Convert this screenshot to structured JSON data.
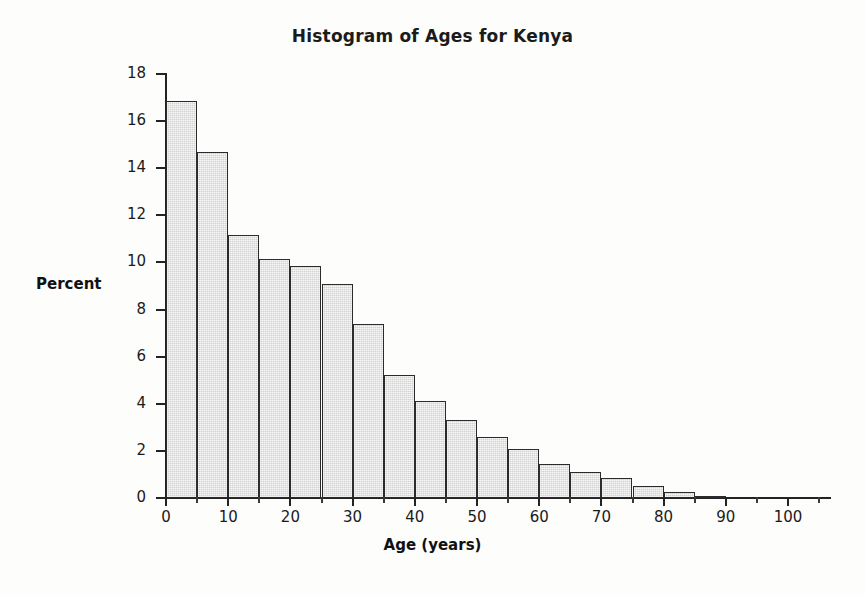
{
  "chart_data": {
    "type": "bar",
    "title": "Histogram of Ages for Kenya",
    "xlabel": "Age (years)",
    "ylabel": "Percent",
    "xlim": [
      0,
      107
    ],
    "ylim": [
      0,
      18
    ],
    "grid": false,
    "legend": false,
    "bin_width": 5,
    "categories": [
      "0-5",
      "5-10",
      "10-15",
      "15-20",
      "20-25",
      "25-30",
      "30-35",
      "35-40",
      "40-45",
      "45-50",
      "50-55",
      "55-60",
      "60-65",
      "65-70",
      "70-75",
      "75-80",
      "80-85",
      "85-90"
    ],
    "bin_starts": [
      0,
      5,
      10,
      15,
      20,
      25,
      30,
      35,
      40,
      45,
      50,
      55,
      60,
      65,
      70,
      75,
      80,
      85
    ],
    "values": [
      16.85,
      14.7,
      11.15,
      10.15,
      9.85,
      9.1,
      7.4,
      5.2,
      4.1,
      3.3,
      2.6,
      2.1,
      1.45,
      1.1,
      0.85,
      0.5,
      0.25,
      0.1
    ],
    "ytick_labels": [
      "0",
      "2",
      "4",
      "6",
      "8",
      "10",
      "12",
      "14",
      "16",
      "18"
    ],
    "ytick_values": [
      0,
      2,
      4,
      6,
      8,
      10,
      12,
      14,
      16,
      18
    ],
    "xtick_labels": [
      "0",
      "10",
      "20",
      "30",
      "40",
      "50",
      "60",
      "70",
      "80",
      "90",
      "100"
    ],
    "xtick_values": [
      0,
      10,
      20,
      30,
      40,
      50,
      60,
      70,
      80,
      90,
      100
    ],
    "xtick_minor_values": [
      5,
      15,
      25,
      35,
      45,
      55,
      65,
      75,
      85,
      95,
      105
    ],
    "bar_fill_color": "#d2d2d2",
    "bar_edge_color": "#2b2b2b",
    "axis_color": "#232323",
    "background_color": "#fdfdfc"
  }
}
